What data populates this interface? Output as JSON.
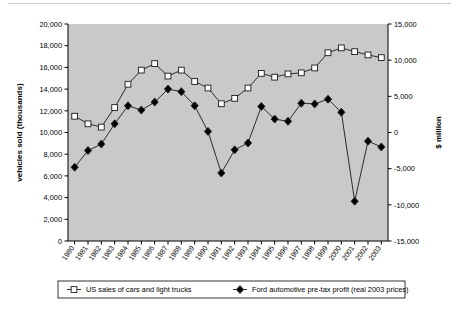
{
  "chart_data": {
    "type": "line",
    "title": "",
    "xlabel": "",
    "ylabel": "vehicles sold (thousands)",
    "y2label": "$ million",
    "grid": false,
    "legend_position": "bottom",
    "x": [
      1980,
      1981,
      1982,
      1983,
      1984,
      1985,
      1986,
      1987,
      1988,
      1989,
      1990,
      1991,
      1992,
      1993,
      1994,
      1995,
      1996,
      1997,
      1998,
      1999,
      2000,
      2001,
      2002,
      2003
    ],
    "categories": [
      "1980",
      "1981",
      "1982",
      "1983",
      "1984",
      "1985",
      "1986",
      "1987",
      "1988",
      "1989",
      "1990",
      "1991",
      "1992",
      "1993",
      "1994",
      "1995",
      "1996",
      "1997",
      "1998",
      "1999",
      "2000",
      "2001",
      "2002",
      "2003"
    ],
    "ylim": [
      0,
      20000
    ],
    "yticks": [
      0,
      2000,
      4000,
      6000,
      8000,
      10000,
      12000,
      14000,
      16000,
      18000,
      20000
    ],
    "yticklabels": [
      "0",
      "2,000",
      "4,000",
      "6,000",
      "8,000",
      "10,000",
      "12,000",
      "14,000",
      "16,000",
      "18,000",
      "20,000"
    ],
    "y2lim": [
      -15000,
      15000
    ],
    "y2ticks": [
      -15000,
      -10000,
      -5000,
      0,
      5000,
      10000,
      15000
    ],
    "y2ticklabels": [
      "-15,000",
      "-10,000",
      "-5,000",
      "0",
      "5,000",
      "10,000",
      "15,000"
    ],
    "series": [
      {
        "name": "US sales of cars and light trucks",
        "axis": "left",
        "marker": "open-square",
        "values": [
          11500,
          10800,
          10500,
          12300,
          14450,
          15750,
          16350,
          15200,
          15750,
          14700,
          14100,
          12650,
          13150,
          14100,
          15450,
          15100,
          15400,
          15500,
          15950,
          17350,
          17800,
          17450,
          17150,
          16900
        ]
      },
      {
        "name": "Ford automotive pre-tax profit (real 2003 prices)",
        "axis": "right",
        "marker": "filled-diamond",
        "values": [
          -4800,
          -2500,
          -1600,
          1200,
          3700,
          3100,
          4200,
          6000,
          5650,
          3700,
          150,
          -5600,
          -2400,
          -1450,
          3600,
          1850,
          1550,
          4050,
          3950,
          4600,
          2800,
          -9500,
          -1200,
          -2000
        ]
      }
    ]
  },
  "legend": {
    "entries": [
      {
        "label": "US sales of cars and light trucks",
        "marker": "open-square"
      },
      {
        "label": "Ford automotive pre-tax profit (real 2003 prices)",
        "marker": "filled-diamond"
      }
    ]
  },
  "colors": {
    "plot_background": "#c9c9c9",
    "page_background": "#ffffff",
    "line": "#1a1a1a",
    "marker_fill_open": "#ffffff",
    "marker_fill_solid": "#000000"
  }
}
